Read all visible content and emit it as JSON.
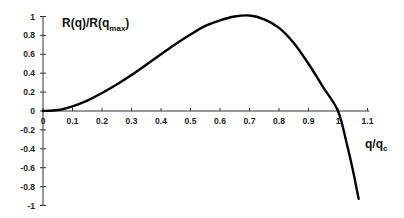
{
  "chart_data": {
    "type": "line",
    "title": "",
    "ylabel": "R(q)/R(q_max)",
    "ylabel_main": "R(q)/R(q",
    "ylabel_sub": "max",
    "ylabel_close": ")",
    "xlabel": "q/q_c",
    "xlabel_main": "q/q",
    "xlabel_sub": "c",
    "xlim": [
      0,
      1.1
    ],
    "ylim": [
      -1,
      1
    ],
    "grid": false,
    "legend": null,
    "x_ticks": [
      "0",
      "0.1",
      "0.2",
      "0.3",
      "0.4",
      "0.5",
      "0.6",
      "0.7",
      "0.8",
      "0.9",
      "1",
      "1.1"
    ],
    "y_ticks": [
      "1",
      "0.8",
      "0.6",
      "0.4",
      "0.2",
      "0",
      "-0.2",
      "-0.4",
      "-0.6",
      "-0.8",
      "-1"
    ],
    "series": [
      {
        "name": "R(q)/R(q_max)",
        "x": [
          0,
          0.05,
          0.1,
          0.15,
          0.2,
          0.25,
          0.3,
          0.35,
          0.4,
          0.45,
          0.5,
          0.55,
          0.6,
          0.65,
          0.7,
          0.75,
          0.8,
          0.85,
          0.9,
          0.95,
          1.0,
          1.03,
          1.05,
          1.07
        ],
        "values": [
          0,
          0.01,
          0.05,
          0.11,
          0.19,
          0.28,
          0.38,
          0.49,
          0.6,
          0.71,
          0.81,
          0.9,
          0.96,
          1.0,
          1.01,
          0.97,
          0.88,
          0.72,
          0.5,
          0.25,
          0.0,
          -0.35,
          -0.62,
          -0.93
        ]
      }
    ]
  }
}
